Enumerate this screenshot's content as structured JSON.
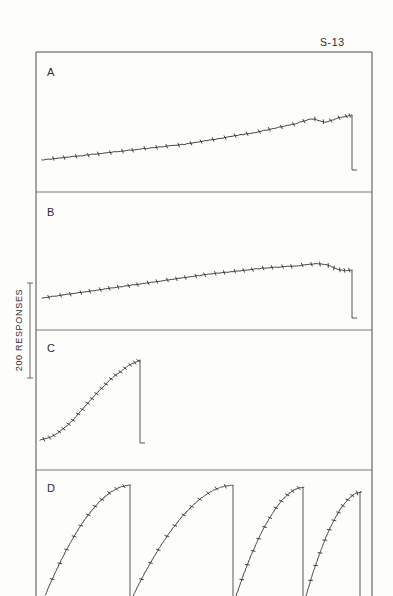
{
  "figure": {
    "subject_label": "S-13",
    "y_axis_label": "200 RESPONSES",
    "panel_labels": [
      "A",
      "B",
      "C",
      "D"
    ]
  },
  "chart_data": {
    "type": "line",
    "title": "S-13",
    "xlabel": "",
    "ylabel": "200 RESPONSES",
    "grid": false,
    "legend": "none",
    "scale_bar": {
      "label": "200 RESPONSES",
      "value": 200,
      "units": "responses",
      "axis": "y",
      "pixel_length": 95
    },
    "x_axis": {
      "units": "time",
      "ticks_shown": false,
      "range_note": "elapsed session time, unlabeled"
    },
    "panels": [
      {
        "label": "A",
        "pattern": "low steady rate, slight positive acceleration near end",
        "reinforcement_pips": 29,
        "resets": 1,
        "series": {
          "name": "cumulative responses A",
          "x": [
            42,
            60,
            78,
            96,
            114,
            132,
            150,
            168,
            186,
            204,
            222,
            240,
            258,
            276,
            294,
            312,
            325,
            338,
            348,
            352
          ],
          "y": [
            160,
            158,
            156,
            154,
            152,
            150,
            148,
            146,
            144,
            141,
            138,
            135,
            132,
            128,
            124,
            119,
            122,
            118,
            116,
            115
          ]
        },
        "reset": {
          "x": 352,
          "y_top": 115,
          "y_bottom": 170
        }
      },
      {
        "label": "B",
        "pattern": "constant intermediate rate, near-linear throughout",
        "reinforcement_pips": 34,
        "resets": 1,
        "series": {
          "name": "cumulative responses B",
          "x": [
            42,
            70,
            98,
            126,
            154,
            182,
            210,
            238,
            266,
            294,
            322,
            340,
            352
          ],
          "y": [
            298,
            294,
            290,
            286,
            282,
            278,
            274,
            271,
            268,
            266,
            264,
            270,
            270
          ]
        },
        "reset": {
          "x": 352,
          "y_top": 270,
          "y_bottom": 318
        }
      },
      {
        "label": "C",
        "pattern": "positively accelerated, rate increases steadily to high terminal rate",
        "reinforcement_pips": 21,
        "resets": 1,
        "series": {
          "name": "cumulative responses C",
          "x": [
            40,
            48,
            56,
            64,
            72,
            80,
            88,
            96,
            104,
            112,
            120,
            128,
            136,
            140
          ],
          "y": [
            440,
            438,
            434,
            428,
            421,
            412,
            403,
            394,
            386,
            378,
            372,
            366,
            362,
            360
          ]
        },
        "reset": {
          "x": 140,
          "y_top": 360,
          "y_bottom": 443
        }
      },
      {
        "label": "D",
        "pattern": "repeating fixed-interval scallops: four cycles of negatively accelerated runs each terminated by a pen reset",
        "reinforcement_pips": 44,
        "resets": 4,
        "cycles": [
          {
            "x_start": 42,
            "x_end": 130,
            "y_start": 596,
            "y_end": 485
          },
          {
            "x_start": 130,
            "x_end": 233,
            "y_start": 596,
            "y_end": 485
          },
          {
            "x_start": 233,
            "x_end": 303,
            "y_start": 596,
            "y_end": 487
          },
          {
            "x_start": 303,
            "x_end": 360,
            "y_start": 596,
            "y_end": 492
          }
        ]
      }
    ]
  },
  "layout": {
    "frame": {
      "left": 36,
      "top": 52,
      "right": 372,
      "bottom": 596
    },
    "dividers_y": [
      192,
      330,
      470
    ],
    "scale_bar": {
      "x": 30,
      "y_top": 283,
      "y_bottom": 378
    }
  },
  "colors": {
    "background": "#fcfcfb",
    "ink": "#1d1d1d",
    "frame": "#4a4a4a",
    "divider": "#6a6a6a"
  }
}
